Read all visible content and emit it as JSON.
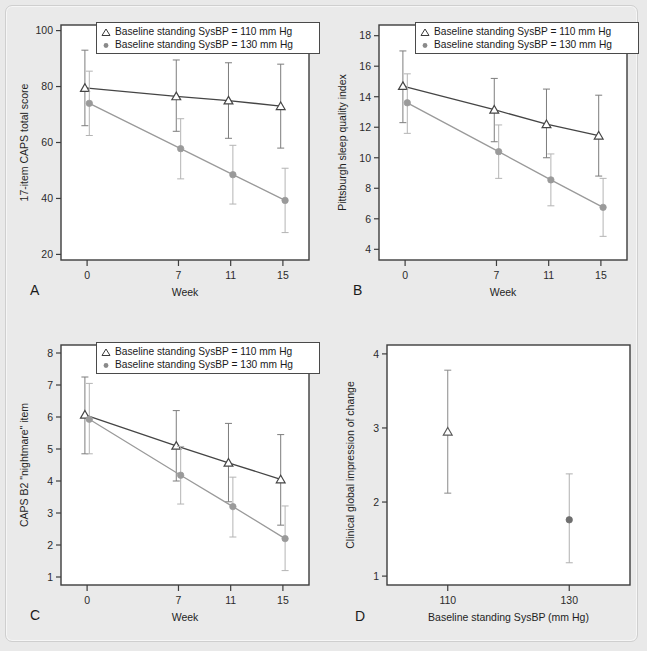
{
  "figure": {
    "background_color": "#e9e9e9",
    "panel_background": "#ffffff",
    "series_colors": {
      "sysbp110": "#454545",
      "sysbp130": "#9a9a9a"
    },
    "legend": {
      "marker_110": "open-triangle",
      "marker_130": "filled-circle",
      "label_110": "Baseline standing SysBP = 110 mm Hg",
      "label_130": "Baseline standing SysBP = 130 mm Hg"
    }
  },
  "panels": [
    {
      "letter": "A",
      "id": "panel-a"
    },
    {
      "letter": "B",
      "id": "panel-b"
    },
    {
      "letter": "C",
      "id": "panel-c"
    },
    {
      "letter": "D",
      "id": "panel-d"
    }
  ],
  "chart_data": [
    {
      "panel": "A",
      "type": "line",
      "title": "",
      "xlabel": "Week",
      "ylabel": "17-item CAPS total score",
      "x": [
        0,
        7,
        11,
        15
      ],
      "xtick_labels": [
        "0",
        "7",
        "11",
        "15"
      ],
      "xlim": [
        -2,
        17
      ],
      "ylim": [
        18,
        102
      ],
      "ytick_labels": [
        "20",
        "40",
        "60",
        "80",
        "100"
      ],
      "yticks": [
        20,
        40,
        60,
        80,
        100
      ],
      "grid": false,
      "legend_position": "top-center",
      "series": [
        {
          "name": "Baseline standing SysBP = 110 mm Hg",
          "marker": "open-triangle",
          "color": "#454545",
          "values": [
            79.5,
            76.5,
            75.0,
            73.0
          ],
          "ci_lower": [
            66.0,
            64.0,
            61.5,
            58.0
          ],
          "ci_upper": [
            93.0,
            89.5,
            88.5,
            88.0
          ]
        },
        {
          "name": "Baseline standing SysBP = 130 mm Hg",
          "marker": "filled-circle",
          "color": "#9a9a9a",
          "values": [
            74.0,
            57.8,
            48.5,
            39.3
          ],
          "ci_lower": [
            62.5,
            47.0,
            38.0,
            27.8
          ],
          "ci_upper": [
            85.5,
            68.5,
            59.0,
            50.8
          ]
        }
      ]
    },
    {
      "panel": "B",
      "type": "line",
      "title": "",
      "xlabel": "Week",
      "ylabel": "Pittsburgh sleep quality index",
      "x": [
        0,
        7,
        11,
        15
      ],
      "xtick_labels": [
        "0",
        "7",
        "11",
        "15"
      ],
      "xlim": [
        -2,
        17
      ],
      "ylim": [
        3.3,
        18.7
      ],
      "ytick_labels": [
        "4",
        "6",
        "8",
        "10",
        "12",
        "14",
        "16",
        "18"
      ],
      "yticks": [
        4,
        6,
        8,
        10,
        12,
        14,
        16,
        18
      ],
      "grid": false,
      "legend_position": "top-center",
      "series": [
        {
          "name": "Baseline standing SysBP = 110 mm Hg",
          "marker": "open-triangle",
          "color": "#454545",
          "values": [
            14.7,
            13.15,
            12.2,
            11.45
          ],
          "ci_lower": [
            12.3,
            11.05,
            10.0,
            8.8
          ],
          "ci_upper": [
            17.0,
            15.2,
            14.5,
            14.1
          ]
        },
        {
          "name": "Baseline standing SysBP = 130 mm Hg",
          "marker": "filled-circle",
          "color": "#9a9a9a",
          "values": [
            13.6,
            10.4,
            8.55,
            6.75
          ],
          "ci_lower": [
            11.6,
            8.65,
            6.85,
            4.85
          ],
          "ci_upper": [
            15.5,
            12.15,
            10.25,
            8.65
          ]
        }
      ]
    },
    {
      "panel": "C",
      "type": "line",
      "title": "",
      "xlabel": "Week",
      "ylabel": "CAPS B2 \"nightmare\" item",
      "x": [
        0,
        7,
        11,
        15
      ],
      "xtick_labels": [
        "0",
        "7",
        "11",
        "15"
      ],
      "xlim": [
        -2,
        17
      ],
      "ylim": [
        0.75,
        8.25
      ],
      "ytick_labels": [
        "1",
        "2",
        "3",
        "4",
        "5",
        "6",
        "7",
        "8"
      ],
      "yticks": [
        1,
        2,
        3,
        4,
        5,
        6,
        7,
        8
      ],
      "grid": false,
      "legend_position": "top-center",
      "series": [
        {
          "name": "Baseline standing SysBP = 110 mm Hg",
          "marker": "open-triangle",
          "color": "#454545",
          "values": [
            6.07,
            5.1,
            4.57,
            4.05
          ],
          "ci_lower": [
            4.85,
            4.0,
            3.35,
            2.62
          ],
          "ci_upper": [
            7.25,
            6.2,
            5.8,
            5.45
          ]
        },
        {
          "name": "Baseline standing SysBP = 130 mm Hg",
          "marker": "filled-circle",
          "color": "#9a9a9a",
          "values": [
            5.93,
            4.18,
            3.2,
            2.2
          ],
          "ci_lower": [
            4.85,
            3.28,
            2.25,
            1.2
          ],
          "ci_upper": [
            7.05,
            5.08,
            4.12,
            3.22
          ]
        }
      ]
    },
    {
      "panel": "D",
      "type": "scatter",
      "title": "",
      "xlabel": "Baseline standing SysBP (mm Hg)",
      "ylabel": "Clinical global impression of change",
      "x": [
        110,
        130
      ],
      "xtick_labels": [
        "110",
        "130"
      ],
      "xlim": [
        100,
        140
      ],
      "ylim": [
        0.88,
        4.12
      ],
      "ytick_labels": [
        "1",
        "2",
        "3",
        "4"
      ],
      "yticks": [
        1,
        2,
        3,
        4
      ],
      "grid": false,
      "legend_position": "none",
      "points": [
        {
          "name": "110",
          "marker": "open-triangle",
          "color": "#6a6a6a",
          "value": 2.95,
          "ci_lower": 2.12,
          "ci_upper": 3.78
        },
        {
          "name": "130",
          "marker": "filled-circle",
          "color": "#8f8f8f",
          "value": 1.76,
          "ci_lower": 1.18,
          "ci_upper": 2.38
        }
      ]
    }
  ]
}
